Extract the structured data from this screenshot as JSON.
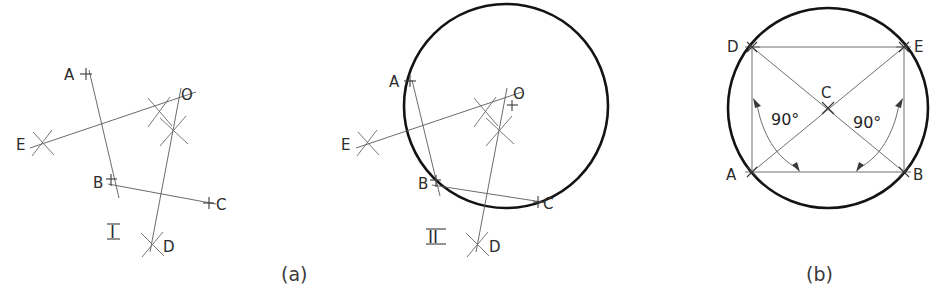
{
  "figure": {
    "background_color": "#ffffff",
    "ink_color": "#2c2c2c",
    "heavy_line_color": "#131313",
    "thin_line_color": "#5a5a5a"
  },
  "captions": {
    "left": "(a)",
    "right": "(b)"
  },
  "panel_a": {
    "step_one": {
      "roman_label": "I",
      "points": [
        {
          "name": "A",
          "label": "A",
          "x": 84,
          "y": 74,
          "marker": "cross-tick"
        },
        {
          "name": "B",
          "label": "B",
          "x": 110,
          "y": 182,
          "marker": "cross-tick"
        },
        {
          "name": "C",
          "label": "C",
          "x": 213,
          "y": 203,
          "marker": "cross-tick"
        },
        {
          "name": "D",
          "label": "D",
          "x": 152,
          "y": 244,
          "marker": "arc-intersection"
        },
        {
          "name": "E",
          "label": "E",
          "x": 41,
          "y": 143,
          "marker": "arc-intersection"
        },
        {
          "name": "O",
          "label": "O",
          "x": 186,
          "y": 99,
          "marker": "point"
        }
      ],
      "bisector_lines": [
        {
          "name": "bisector-AB",
          "from": "E",
          "to": "O"
        },
        {
          "name": "bisector-BC",
          "from": "A",
          "to": "D"
        }
      ],
      "chords": [
        {
          "name": "chord-AB",
          "from": "A",
          "to": "B"
        },
        {
          "name": "chord-BC",
          "from": "B",
          "to": "C"
        }
      ]
    },
    "step_two": {
      "roman_label": "II",
      "circle": {
        "cx": 506,
        "cy": 106,
        "r": 102
      },
      "points": [
        {
          "name": "A",
          "label": "A",
          "x": 410,
          "y": 81,
          "marker": "cross-tick"
        },
        {
          "name": "B",
          "label": "B",
          "x": 434,
          "y": 183,
          "marker": "cross-tick"
        },
        {
          "name": "C",
          "label": "C",
          "x": 539,
          "y": 201,
          "marker": "cross-tick"
        },
        {
          "name": "D",
          "label": "D",
          "x": 477,
          "y": 244,
          "marker": "arc-intersection"
        },
        {
          "name": "E",
          "label": "E",
          "x": 366,
          "y": 143,
          "marker": "arc-intersection"
        },
        {
          "name": "O",
          "label": "O",
          "x": 512,
          "y": 98,
          "marker": "center-point"
        }
      ]
    }
  },
  "panel_b": {
    "circle": {
      "cx": 828,
      "cy": 108,
      "r": 100
    },
    "points": [
      {
        "name": "A",
        "label": "A",
        "x": 752,
        "y": 172,
        "marker": "tick"
      },
      {
        "name": "B",
        "label": "B",
        "x": 904,
        "y": 172,
        "marker": "tick"
      },
      {
        "name": "C",
        "label": "C",
        "x": 828,
        "y": 108,
        "marker": "center-cross"
      },
      {
        "name": "D",
        "label": "D",
        "x": 752,
        "y": 47,
        "marker": "tick"
      },
      {
        "name": "E",
        "label": "E",
        "x": 904,
        "y": 47,
        "marker": "tick"
      }
    ],
    "angles": [
      {
        "name": "angle-left",
        "label": "90°",
        "x": 790,
        "y": 119,
        "value": 90,
        "unit": "degrees"
      },
      {
        "name": "angle-right",
        "label": "90°",
        "x": 872,
        "y": 122,
        "value": 90,
        "unit": "degrees"
      }
    ],
    "diagonals": [
      {
        "name": "diagonal-DB",
        "from": "D",
        "to": "B"
      },
      {
        "name": "diagonal-AE",
        "from": "A",
        "to": "E"
      }
    ],
    "sides": [
      {
        "name": "side-DA",
        "from": "D",
        "to": "A"
      },
      {
        "name": "side-EB",
        "from": "E",
        "to": "B"
      },
      {
        "name": "side-AB",
        "from": "A",
        "to": "B"
      },
      {
        "name": "side-DE",
        "from": "D",
        "to": "E"
      }
    ]
  }
}
